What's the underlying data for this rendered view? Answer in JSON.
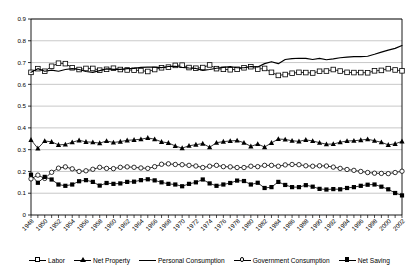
{
  "chart_data": {
    "type": "line",
    "title": "",
    "xlabel": "",
    "ylabel": "",
    "ylim": [
      0,
      0.9
    ],
    "ytick_step": 0.1,
    "yticks": [
      "0",
      "0.1",
      "0.2",
      "0.3",
      "0.4",
      "0.5",
      "0.6",
      "0.7",
      "0.8",
      "0.9"
    ],
    "grid": true,
    "grid_axis": "y",
    "legend_position": "bottom",
    "xtick_label_rotation": 45,
    "xtick_label_step": 2,
    "x": [
      1948,
      1949,
      1950,
      1951,
      1952,
      1953,
      1954,
      1955,
      1956,
      1957,
      1958,
      1959,
      1960,
      1961,
      1962,
      1963,
      1964,
      1965,
      1966,
      1967,
      1968,
      1969,
      1970,
      1971,
      1972,
      1973,
      1974,
      1975,
      1976,
      1977,
      1978,
      1979,
      1980,
      1981,
      1982,
      1983,
      1984,
      1985,
      1986,
      1987,
      1988,
      1989,
      1990,
      1991,
      1992,
      1993,
      1994,
      1995,
      1996,
      1997,
      1998,
      1999,
      2000,
      2001,
      2002
    ],
    "xticklabels": [
      "1948",
      "1950",
      "1952",
      "1954",
      "1956",
      "1958",
      "1960",
      "1962",
      "1964",
      "1966",
      "1968",
      "1970",
      "1972",
      "1974",
      "1976",
      "1978",
      "1980",
      "1982",
      "1984",
      "1986",
      "1988",
      "1990",
      "1992",
      "1994",
      "1996",
      "1998",
      "2000",
      "2002"
    ],
    "series": [
      {
        "name": "Labor",
        "marker": "open-square",
        "color": "#000000",
        "values": [
          0.655,
          0.672,
          0.66,
          0.683,
          0.697,
          0.695,
          0.676,
          0.668,
          0.673,
          0.673,
          0.665,
          0.669,
          0.674,
          0.668,
          0.666,
          0.665,
          0.663,
          0.659,
          0.668,
          0.676,
          0.679,
          0.687,
          0.688,
          0.677,
          0.674,
          0.677,
          0.689,
          0.672,
          0.669,
          0.667,
          0.669,
          0.676,
          0.681,
          0.67,
          0.673,
          0.655,
          0.641,
          0.645,
          0.651,
          0.655,
          0.654,
          0.652,
          0.66,
          0.661,
          0.668,
          0.661,
          0.655,
          0.654,
          0.654,
          0.653,
          0.662,
          0.664,
          0.672,
          0.666,
          0.662
        ]
      },
      {
        "name": "Net Property",
        "marker": "filled-triangle",
        "color": "#000000",
        "values": [
          0.345,
          0.306,
          0.34,
          0.336,
          0.322,
          0.324,
          0.334,
          0.343,
          0.336,
          0.334,
          0.33,
          0.34,
          0.333,
          0.337,
          0.343,
          0.345,
          0.348,
          0.354,
          0.348,
          0.336,
          0.331,
          0.317,
          0.307,
          0.318,
          0.323,
          0.328,
          0.311,
          0.332,
          0.337,
          0.34,
          0.342,
          0.332,
          0.315,
          0.326,
          0.312,
          0.331,
          0.349,
          0.347,
          0.341,
          0.338,
          0.345,
          0.34,
          0.332,
          0.325,
          0.326,
          0.334,
          0.34,
          0.341,
          0.344,
          0.348,
          0.341,
          0.334,
          0.322,
          0.327,
          0.338
        ]
      },
      {
        "name": "Personal Consumption",
        "marker": "none",
        "color": "#000000",
        "values": [
          0.655,
          0.672,
          0.66,
          0.665,
          0.66,
          0.668,
          0.672,
          0.668,
          0.659,
          0.655,
          0.663,
          0.671,
          0.669,
          0.669,
          0.672,
          0.673,
          0.678,
          0.679,
          0.679,
          0.677,
          0.682,
          0.683,
          0.678,
          0.675,
          0.673,
          0.664,
          0.668,
          0.674,
          0.678,
          0.681,
          0.676,
          0.676,
          0.682,
          0.68,
          0.695,
          0.704,
          0.695,
          0.714,
          0.718,
          0.72,
          0.719,
          0.714,
          0.719,
          0.713,
          0.717,
          0.722,
          0.725,
          0.727,
          0.727,
          0.729,
          0.738,
          0.748,
          0.757,
          0.765,
          0.778
        ]
      },
      {
        "name": "Government Consumption",
        "marker": "open-circle",
        "color": "#000000",
        "values": [
          0.166,
          0.183,
          0.168,
          0.196,
          0.215,
          0.221,
          0.212,
          0.2,
          0.203,
          0.21,
          0.219,
          0.214,
          0.213,
          0.219,
          0.221,
          0.219,
          0.216,
          0.214,
          0.222,
          0.233,
          0.235,
          0.232,
          0.231,
          0.228,
          0.225,
          0.218,
          0.224,
          0.228,
          0.222,
          0.221,
          0.218,
          0.218,
          0.224,
          0.222,
          0.228,
          0.228,
          0.224,
          0.23,
          0.232,
          0.231,
          0.226,
          0.224,
          0.226,
          0.225,
          0.22,
          0.214,
          0.209,
          0.205,
          0.2,
          0.195,
          0.192,
          0.191,
          0.19,
          0.195,
          0.201
        ]
      },
      {
        "name": "Net Saving",
        "marker": "filled-square",
        "color": "#000000",
        "values": [
          0.185,
          0.148,
          0.175,
          0.163,
          0.14,
          0.134,
          0.14,
          0.155,
          0.16,
          0.152,
          0.135,
          0.147,
          0.143,
          0.145,
          0.152,
          0.153,
          0.16,
          0.164,
          0.159,
          0.15,
          0.143,
          0.14,
          0.132,
          0.143,
          0.15,
          0.163,
          0.145,
          0.134,
          0.14,
          0.147,
          0.158,
          0.156,
          0.14,
          0.148,
          0.124,
          0.128,
          0.152,
          0.138,
          0.128,
          0.128,
          0.137,
          0.13,
          0.12,
          0.117,
          0.119,
          0.118,
          0.124,
          0.128,
          0.134,
          0.139,
          0.14,
          0.13,
          0.118,
          0.101,
          0.09
        ]
      }
    ]
  },
  "legend": {
    "items": [
      {
        "label": "Labor",
        "marker": "open-square"
      },
      {
        "label": "Net Property",
        "marker": "filled-triangle"
      },
      {
        "label": "Personal Consumption",
        "marker": "none"
      },
      {
        "label": "Government Consumption",
        "marker": "open-circle"
      },
      {
        "label": "Net Saving",
        "marker": "filled-square"
      }
    ]
  }
}
